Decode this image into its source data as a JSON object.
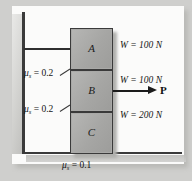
{
  "figure": {
    "type": "statics-free-body-diagram"
  },
  "blocks": [
    {
      "id": "A",
      "label": "A",
      "weight_label": "W = 100 N",
      "weight_value": 100,
      "weight_unit": "N"
    },
    {
      "id": "B",
      "label": "B",
      "weight_label": "W = 100 N",
      "weight_value": 100,
      "weight_unit": "N"
    },
    {
      "id": "C",
      "label": "C",
      "weight_label": "W = 200 N",
      "weight_value": 200,
      "weight_unit": "N"
    }
  ],
  "friction": [
    {
      "id": "interface-ab",
      "symbol": "μ",
      "subscript": "s",
      "equals": "=",
      "value": "0.2",
      "full": "μs = 0.2"
    },
    {
      "id": "interface-bc",
      "symbol": "μ",
      "subscript": "s",
      "equals": "=",
      "value": "0.2",
      "full": "μs = 0.2"
    },
    {
      "id": "interface-ground",
      "symbol": "μ",
      "subscript": "s",
      "equals": "=",
      "value": "0.1",
      "full": "μs = 0.1"
    }
  ],
  "force": {
    "label": "P",
    "direction": "right",
    "applied_to": "B"
  },
  "colors": {
    "block_fill": "#a9a9a7",
    "outline": "#3a3a3a",
    "paper": "#fbfbfa",
    "page_background": "#cfcfcd",
    "text": "#141414"
  }
}
